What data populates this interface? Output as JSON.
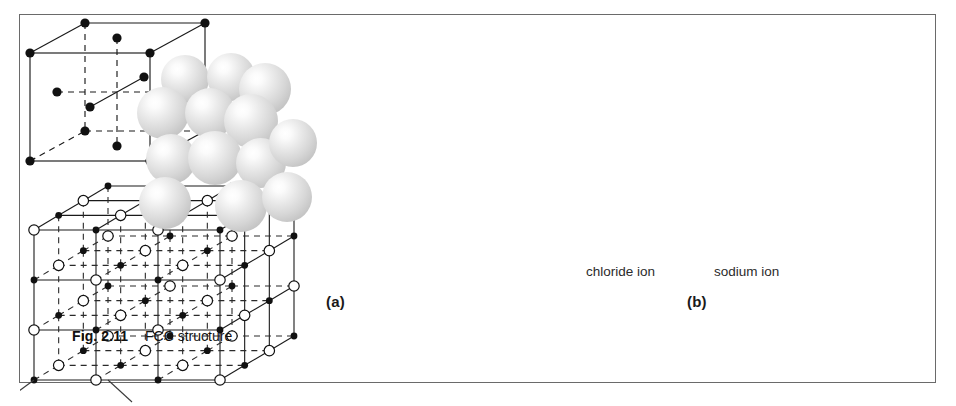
{
  "figure": {
    "caption_id": "Fig. 2.11",
    "caption_text": "FCC structure",
    "panels": [
      {
        "key": "a",
        "label": "(a)",
        "description": "close-packed sphere model and FCC unit cell"
      },
      {
        "key": "b",
        "label": "(b)",
        "description": "sodium chloride rock-salt lattice"
      }
    ]
  },
  "panel_a": {
    "label": "(a)",
    "sphere_model": {
      "name": "sphere-cluster",
      "sphere_count": 13,
      "sphere_fill": "#d6d6d6",
      "highlight_color": "#ffffff",
      "spheres": [
        {
          "cx": 60,
          "cy": 28,
          "r": 24
        },
        {
          "cx": 106,
          "cy": 26,
          "r": 24
        },
        {
          "cx": 140,
          "cy": 38,
          "r": 26
        },
        {
          "cx": 38,
          "cy": 62,
          "r": 26
        },
        {
          "cx": 85,
          "cy": 62,
          "r": 25
        },
        {
          "cx": 126,
          "cy": 70,
          "r": 27
        },
        {
          "cx": 46,
          "cy": 108,
          "r": 25
        },
        {
          "cx": 90,
          "cy": 107,
          "r": 27
        },
        {
          "cx": 136,
          "cy": 112,
          "r": 25
        },
        {
          "cx": 168,
          "cy": 92,
          "r": 24
        },
        {
          "cx": 40,
          "cy": 152,
          "r": 26
        },
        {
          "cx": 116,
          "cy": 155,
          "r": 26
        },
        {
          "cx": 162,
          "cy": 146,
          "r": 25
        }
      ]
    },
    "unit_cell": {
      "name": "fcc-unit-cell",
      "atom_color": "#111111",
      "edge_color": "#1a1a1a",
      "corner_atoms": 8,
      "face_atoms": 6,
      "front_face": {
        "x": 10,
        "y": 38,
        "w": 120,
        "h": 108
      },
      "depth": {
        "dx": 55,
        "dy": -30
      },
      "corner_radius": 4.6,
      "face_radius": 4.6
    }
  },
  "panel_b": {
    "label": "(b)",
    "lattice": {
      "name": "nacl-lattice",
      "grid": 3,
      "chloride_ion": {
        "style": "open-circle",
        "fill": "#ffffff",
        "stroke": "#111111",
        "radius": 5.2
      },
      "sodium_ion": {
        "style": "filled-dot",
        "fill": "#111111",
        "radius": 3.4
      },
      "front_face": {
        "x": 14,
        "y": 60,
        "w": 186,
        "h": 150
      },
      "depth": {
        "dx": 74,
        "dy": -44
      },
      "solid_edge_color": "#1a1a1a",
      "dashed_edge_color": "#2a2a2a"
    },
    "callouts": [
      {
        "label": "chloride ion",
        "target": "open-circle at front-bottom-left",
        "leader": true
      },
      {
        "label": "sodium ion",
        "target": "filled-dot on bottom front edge",
        "leader": true
      }
    ]
  },
  "frame": {
    "border_color": "#6a6a6a",
    "background": "#ffffff"
  }
}
